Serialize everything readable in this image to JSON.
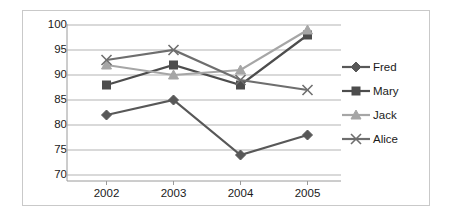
{
  "chart_data": {
    "type": "line",
    "title": "",
    "xlabel": "",
    "ylabel": "",
    "categories": [
      "2002",
      "2003",
      "2004",
      "2005"
    ],
    "ylim": [
      70,
      100
    ],
    "yticks": [
      70,
      75,
      80,
      85,
      90,
      95,
      100
    ],
    "grid": true,
    "legend_position": "right",
    "series": [
      {
        "name": "Fred",
        "marker": "diamond",
        "color": "#585858",
        "values": [
          82,
          85,
          74,
          78
        ]
      },
      {
        "name": "Mary",
        "marker": "square",
        "color": "#4d4d4d",
        "values": [
          88,
          92,
          88,
          98
        ]
      },
      {
        "name": "Jack",
        "marker": "triangle",
        "color": "#a6a6a6",
        "values": [
          92,
          90,
          91,
          99
        ]
      },
      {
        "name": "Alice",
        "marker": "cross",
        "color": "#6e6e6e",
        "values": [
          93,
          95,
          89,
          87
        ]
      }
    ]
  },
  "legend": {
    "entries": [
      {
        "label": "Fred"
      },
      {
        "label": "Mary"
      },
      {
        "label": "Jack"
      },
      {
        "label": "Alice"
      }
    ]
  },
  "axes": {
    "y_tick_labels": [
      "100",
      "95",
      "90",
      "85",
      "80",
      "75",
      "70"
    ],
    "x_tick_labels": [
      "2002",
      "2003",
      "2004",
      "2005"
    ]
  },
  "colors": {
    "frame_border": "#c9c9c9",
    "gridline": "#b3b3b3",
    "axis_line": "#9a9a9a",
    "text": "#1a1a1a",
    "background": "#ffffff"
  }
}
